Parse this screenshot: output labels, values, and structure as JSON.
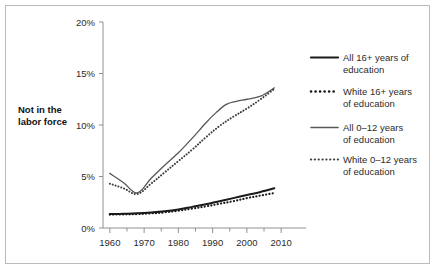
{
  "figure": {
    "border_color": "#b9bcbe",
    "background": "#ffffff"
  },
  "chart_data": {
    "type": "line",
    "title": "",
    "subtitle": "",
    "xlabel": "",
    "ylabel": "Not in the labor force",
    "xlim": [
      1958,
      2012
    ],
    "ylim": [
      0,
      20
    ],
    "grid": false,
    "legend_position": "right",
    "x_tick_labels": [
      "1960",
      "1970",
      "1980",
      "1990",
      "2000",
      "2010"
    ],
    "x_ticks": [
      1960,
      1970,
      1980,
      1990,
      2000,
      2010
    ],
    "x_minor_ticks": [
      1965,
      1975,
      1985,
      1995,
      2005
    ],
    "y_tick_labels": [
      "0%",
      "5%",
      "10%",
      "15%",
      "20%"
    ],
    "y_ticks": [
      0,
      5,
      10,
      15,
      20
    ],
    "series": [
      {
        "name": "All 16+ years of education",
        "style": "solid",
        "color": "#1a1a1a",
        "width": 2.0,
        "x": [
          1960,
          1964,
          1968,
          1972,
          1976,
          1980,
          1984,
          1988,
          1992,
          1996,
          2000,
          2004,
          2008
        ],
        "values": [
          1.35,
          1.38,
          1.42,
          1.5,
          1.62,
          1.8,
          2.05,
          2.3,
          2.6,
          2.9,
          3.2,
          3.5,
          3.85
        ]
      },
      {
        "name": "White 16+ years of education",
        "style": "dotted",
        "color": "#1a1a1a",
        "width": 2.2,
        "x": [
          1960,
          1964,
          1968,
          1972,
          1976,
          1980,
          1984,
          1988,
          1992,
          1996,
          2000,
          2004,
          2008
        ],
        "values": [
          1.3,
          1.32,
          1.35,
          1.42,
          1.52,
          1.68,
          1.88,
          2.1,
          2.35,
          2.6,
          2.9,
          3.15,
          3.4
        ]
      },
      {
        "name": "All 0–12 years of education",
        "style": "solid",
        "color": "#55585b",
        "width": 1.3,
        "x": [
          1960,
          1964,
          1968,
          1972,
          1976,
          1980,
          1984,
          1988,
          1991,
          1994,
          1997,
          2000,
          2004,
          2008
        ],
        "values": [
          5.3,
          4.4,
          3.4,
          4.8,
          6.1,
          7.3,
          8.7,
          10.2,
          11.2,
          12.0,
          12.3,
          12.5,
          12.8,
          13.6
        ]
      },
      {
        "name": "White 0–12 years of education",
        "style": "dotted",
        "color": "#3a3d40",
        "width": 2.0,
        "x": [
          1960,
          1964,
          1968,
          1972,
          1976,
          1980,
          1984,
          1988,
          1992,
          1996,
          2000,
          2004,
          2008
        ],
        "values": [
          4.3,
          3.85,
          3.3,
          4.3,
          5.4,
          6.5,
          7.6,
          8.8,
          9.9,
          10.8,
          11.6,
          12.5,
          13.5
        ]
      }
    ]
  },
  "legend": {
    "items": [
      {
        "label_line1": "All 16+ years of",
        "label_line2": "education",
        "style": "solid",
        "color": "#1a1a1a",
        "width": 2.2
      },
      {
        "label_line1": "White 16+ years",
        "label_line2": "of education",
        "style": "dotted",
        "color": "#1a1a1a",
        "width": 2.6
      },
      {
        "label_line1": "All 0–12 years",
        "label_line2": "of education",
        "style": "solid",
        "color": "#55585b",
        "width": 1.6
      },
      {
        "label_line1": "White 0–12 years",
        "label_line2": "of education",
        "style": "dotted",
        "color": "#3a3d40",
        "width": 2.2
      }
    ]
  },
  "axis_title": {
    "line1": "Not in the",
    "line2": "labor force"
  }
}
